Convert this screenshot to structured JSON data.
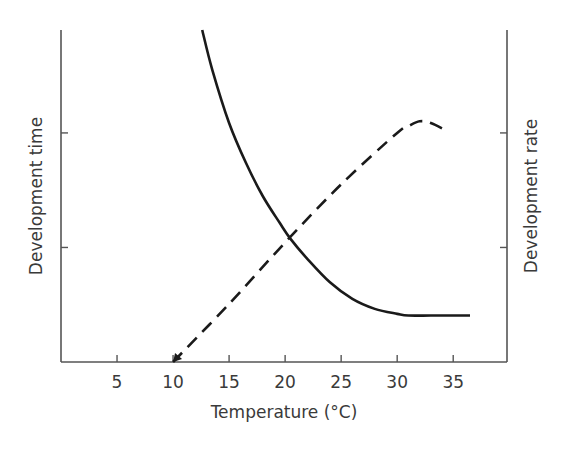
{
  "chart_data": {
    "type": "line",
    "title": "",
    "xlabel": "Temperature (°C)",
    "ylabel_left": "Development time",
    "ylabel_right": "Development rate",
    "xlim": [
      0,
      39.8
    ],
    "ylim": [
      0,
      1
    ],
    "x_ticks": [
      5,
      10,
      15,
      20,
      25,
      30,
      35
    ],
    "x_tick_labels": [
      "5",
      "10",
      "15",
      "20",
      "25",
      "30",
      "35"
    ],
    "y_ticks_left": [
      0.345,
      0.69
    ],
    "y_ticks_right": [
      0.345,
      0.69
    ],
    "y_tick_labels": [],
    "grid": false,
    "legend": null,
    "series": [
      {
        "name": "Development time",
        "axis": "left",
        "style": "solid",
        "color": "#1a1a1a",
        "x": [
          12.6,
          13.5,
          15,
          16.5,
          18,
          19.5,
          20.5,
          22,
          24,
          26,
          28,
          30,
          31,
          33,
          35,
          36.5
        ],
        "y": [
          1.0,
          0.88,
          0.72,
          0.6,
          0.5,
          0.42,
          0.37,
          0.31,
          0.24,
          0.19,
          0.16,
          0.145,
          0.14,
          0.14,
          0.14,
          0.14
        ]
      },
      {
        "name": "Development rate",
        "axis": "right",
        "style": "dashed",
        "color": "#1a1a1a",
        "x": [
          10,
          15,
          20,
          25,
          30,
          31,
          32,
          33,
          34.5
        ],
        "y": [
          0.0,
          0.175,
          0.36,
          0.535,
          0.69,
          0.71,
          0.725,
          0.72,
          0.695
        ]
      }
    ]
  },
  "axes": {
    "x_title": "Temperature (°C)",
    "left_title": "Development time",
    "right_title": "Development rate"
  },
  "colors": {
    "axis": "#555555",
    "curve": "#1a1a1a",
    "text": "#3a3a3a"
  }
}
